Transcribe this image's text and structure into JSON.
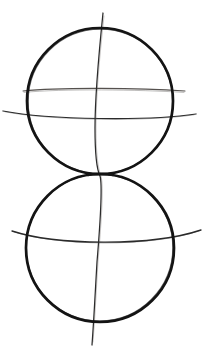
{
  "page": {
    "background_color": "#ffffff",
    "width": 213,
    "height": 353,
    "medium": "pencil line drawing"
  },
  "palette": {
    "paper": "#ffffff",
    "outline_ink": "#141414",
    "guide_ink": "#2b2b2b",
    "faint_ink": "#55514e"
  },
  "figure": {
    "caption": "",
    "shapes": [
      {
        "name": "upper-sphere-outline",
        "type": "circle",
        "cx": 100,
        "cy": 101,
        "r": 73,
        "stroke_width": 2.6,
        "stroke": "#141414"
      },
      {
        "name": "lower-sphere-outline",
        "type": "circle",
        "cx": 100,
        "cy": 248,
        "r": 74,
        "stroke_width": 2.6,
        "stroke": "#141414"
      },
      {
        "name": "vertical-axis-curve",
        "type": "open-curve",
        "stroke_width": 1.2,
        "stroke": "#2b2b2b",
        "path": "M 103,13 C 99,52 95,92 95,128 C 95,160 98,172 100,176 C 103,186 100,226 97,262 C 95,296 94,318 92,345"
      },
      {
        "name": "upper-sphere-equator-upper-guide",
        "type": "open-curve",
        "stroke_width": 1.1,
        "stroke": "#55514e",
        "path": "M 23,91 C 60,87 140,88 185,91"
      },
      {
        "name": "upper-sphere-equator-lower-guide",
        "type": "open-curve",
        "stroke_width": 1.2,
        "stroke": "#2b2b2b",
        "path": "M 3,111 C 50,120 150,121 196,114"
      },
      {
        "name": "lower-sphere-equator-guide",
        "type": "open-curve",
        "stroke_width": 1.3,
        "stroke": "#2b2b2b",
        "path": "M 12,231 C 55,245 150,247 201,230"
      }
    ],
    "tangent_point": {
      "name": "spheres-tangent-point",
      "x": 100,
      "y": 175
    }
  }
}
